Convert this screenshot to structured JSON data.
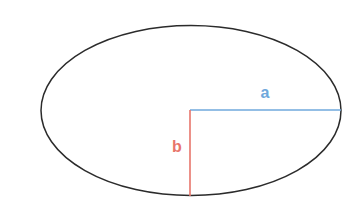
{
  "figure": {
    "background_color": "#ffffff",
    "width": 356,
    "height": 212
  },
  "ellipse": {
    "name": "ellipse-outline",
    "stroke_color": "#2b2b2b",
    "fill_color": "none",
    "stroke_width": 1.5,
    "center_x": 191,
    "center_y": 110.5,
    "radius_x": 150,
    "radius_y": 85
  },
  "semi_major_axis": {
    "label": "a",
    "color": "#6fa8dc",
    "stroke_width": 1.6,
    "x1": 190,
    "y1": 110,
    "x2": 341,
    "y2": 110,
    "label_x": 265,
    "label_y": 98
  },
  "semi_minor_axis": {
    "label": "b",
    "color": "#e8756b",
    "stroke_width": 1.6,
    "x1": 190,
    "y1": 110,
    "x2": 190,
    "y2": 196,
    "label_x": 177,
    "label_y": 152
  },
  "chart_data": {
    "type": "diagram",
    "shape": "ellipse",
    "center": [
      191,
      110.5
    ],
    "semi_axes": [
      {
        "name": "a",
        "orientation": "horizontal",
        "length_px": 150,
        "color": "#6fa8dc"
      },
      {
        "name": "b",
        "orientation": "vertical",
        "length_px": 85,
        "color": "#e8756b"
      }
    ],
    "annotations": [
      "a",
      "b"
    ],
    "xlabel": "",
    "ylabel": "",
    "grid": false,
    "legend": "none"
  }
}
